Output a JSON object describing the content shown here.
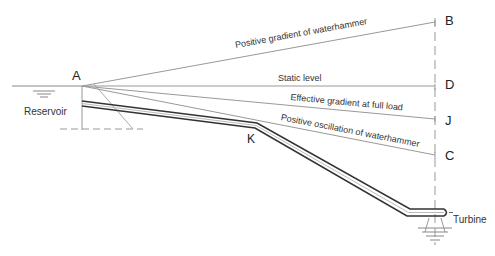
{
  "diagram": {
    "title": "",
    "points": {
      "A": "A",
      "B": "B",
      "D": "D",
      "J": "J",
      "C": "C",
      "K": "K"
    },
    "labels": {
      "reservoir": "Reservoir",
      "turbine": "Turbine",
      "positive_gradient": "Positive gradient of waterhammer",
      "static_level": "Static level",
      "effective_gradient": "Effective gradient at full load",
      "positive_oscillation": "Positive oscillation of waterhammer"
    },
    "colors": {
      "line": "#999999",
      "pipe": "#333333",
      "text": "#222222"
    }
  }
}
